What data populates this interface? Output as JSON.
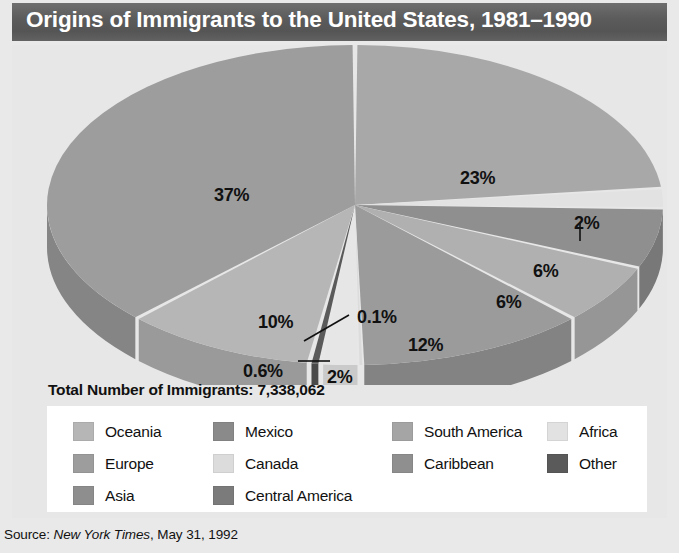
{
  "title": "Origins of Immigrants to the United States, 1981–1990",
  "total_label": "Total Number of Immigrants: 7,338,062",
  "source": {
    "prefix": "Source: ",
    "publication": "New York Times",
    "suffix": ", May 31, 1992"
  },
  "legend": {
    "items": [
      {
        "label": "Oceania",
        "color": "#b6b6b6",
        "col": 0,
        "row": 0
      },
      {
        "label": "Europe",
        "color": "#9d9d9d",
        "col": 0,
        "row": 1
      },
      {
        "label": "Asia",
        "color": "#8e8e8e",
        "col": 0,
        "row": 2
      },
      {
        "label": "Mexico",
        "color": "#8a8a8a",
        "col": 1,
        "row": 0
      },
      {
        "label": "Canada",
        "color": "#dcdcdc",
        "col": 1,
        "row": 1
      },
      {
        "label": "Central America",
        "color": "#7b7b7b",
        "col": 1,
        "row": 2
      },
      {
        "label": "South America",
        "color": "#a5a5a5",
        "col": 2,
        "row": 0
      },
      {
        "label": "Caribbean",
        "color": "#8f8f8f",
        "col": 2,
        "row": 1
      },
      {
        "label": "Africa",
        "color": "#e2e2e2",
        "col": 3,
        "row": 0
      },
      {
        "label": "Other",
        "color": "#5a5a5a",
        "col": 3,
        "row": 1
      }
    ]
  },
  "chart_data": {
    "type": "pie",
    "title": "Origins of Immigrants to the United States, 1981–1990",
    "total": 7338062,
    "total_label": "Total Number of Immigrants: 7,338,062",
    "units": "percent",
    "three_d": true,
    "legend_position": "bottom",
    "labels": [
      "Europe",
      "Asia",
      "Africa",
      "Caribbean",
      "South America",
      "Central America",
      "Mexico",
      "Canada",
      "Oceania",
      "Other"
    ],
    "values": [
      37,
      23,
      2,
      6,
      6,
      12,
      2,
      0.1,
      0.6,
      10
    ],
    "slices": [
      {
        "label": "Asia",
        "value": 23,
        "display": "23%",
        "color": "#a8a8a8",
        "side_color": "#8f8f8f"
      },
      {
        "label": "Africa",
        "value": 2,
        "display": "2%",
        "color": "#e2e2e2",
        "side_color": "#c4c4c4"
      },
      {
        "label": "Caribbean",
        "value": 6,
        "display": "6%",
        "color": "#8f8f8f",
        "side_color": "#787878"
      },
      {
        "label": "South America",
        "value": 6,
        "display": "6%",
        "color": "#b0b0b0",
        "side_color": "#969696"
      },
      {
        "label": "Central America",
        "value": 12,
        "display": "12%",
        "color": "#9b9b9b",
        "side_color": "#838383"
      },
      {
        "label": "Canada",
        "value": 0.1,
        "display": "0.1%",
        "color": "#dcdcdc",
        "side_color": "#c0c0c0"
      },
      {
        "label": "Mexico",
        "value": 2,
        "display": "2%",
        "color": "#e6e6e6",
        "side_color": "#cacaca"
      },
      {
        "label": "Other",
        "value": 0.6,
        "display": "0.6%",
        "color": "#5a5a5a",
        "side_color": "#4a4a4a"
      },
      {
        "label": "Oceania",
        "value": 10,
        "display": "10%",
        "color": "#b6b6b6",
        "side_color": "#9a9a9a"
      },
      {
        "label": "Europe",
        "value": 37,
        "display": "37%",
        "color": "#9d9d9d",
        "side_color": "#858585"
      }
    ],
    "annotations": [
      {
        "text": "37%",
        "x": 202,
        "y": 140
      },
      {
        "text": "23%",
        "x": 448,
        "y": 123
      },
      {
        "text": "2%",
        "x": 562,
        "y": 168
      },
      {
        "text": "6%",
        "x": 521,
        "y": 216
      },
      {
        "text": "6%",
        "x": 484,
        "y": 247
      },
      {
        "text": "12%",
        "x": 396,
        "y": 290
      },
      {
        "text": "0.1%",
        "x": 345,
        "y": 262
      },
      {
        "text": "2%",
        "x": 315,
        "y": 322
      },
      {
        "text": "0.6%",
        "x": 231,
        "y": 316
      },
      {
        "text": "10%",
        "x": 246,
        "y": 267
      }
    ]
  }
}
